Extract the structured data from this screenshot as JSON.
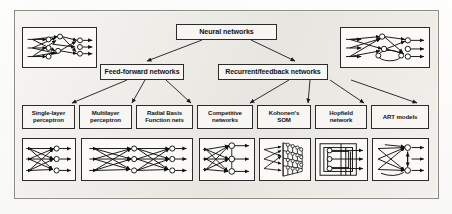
{
  "figure": {
    "type": "hierarchy-diagram",
    "background_color": "#eceae4",
    "box_fill_color": "#f7f6f3",
    "line_color": "#1a1a1a"
  },
  "tree": {
    "root": {
      "label": "Neural networks"
    },
    "branches": [
      {
        "label": "Feed-forward networks"
      },
      {
        "label": "Recurrent/feedback networks"
      }
    ],
    "leaves": [
      {
        "label": "Single-layer\nperceptron",
        "parent": "Feed-forward networks"
      },
      {
        "label": "Multilayer\nperceptron",
        "parent": "Feed-forward networks"
      },
      {
        "label": "Radial Basis\nFunction nets",
        "parent": "Feed-forward networks"
      },
      {
        "label": "Competitive\nnetworks",
        "parent": "Recurrent/feedback networks"
      },
      {
        "label": "Kohonen's\nSOM",
        "parent": "Recurrent/feedback networks"
      },
      {
        "label": "Hopfield\nnetwork",
        "parent": "Recurrent/feedback networks"
      },
      {
        "label": "ART models",
        "parent": "Recurrent/feedback networks"
      }
    ]
  },
  "illustrations": {
    "top_left": {
      "name": "dense-recurrent-network-sketch"
    },
    "top_right": {
      "name": "dense-feedback-network-sketch"
    },
    "bottom": [
      {
        "name": "single-layer-perceptron-sketch"
      },
      {
        "name": "multilayer-perceptron-sketch"
      },
      {
        "name": "competitive-network-sketch"
      },
      {
        "name": "kohonen-som-lattice-sketch"
      },
      {
        "name": "hopfield-network-sketch"
      },
      {
        "name": "art-model-sketch"
      }
    ]
  }
}
